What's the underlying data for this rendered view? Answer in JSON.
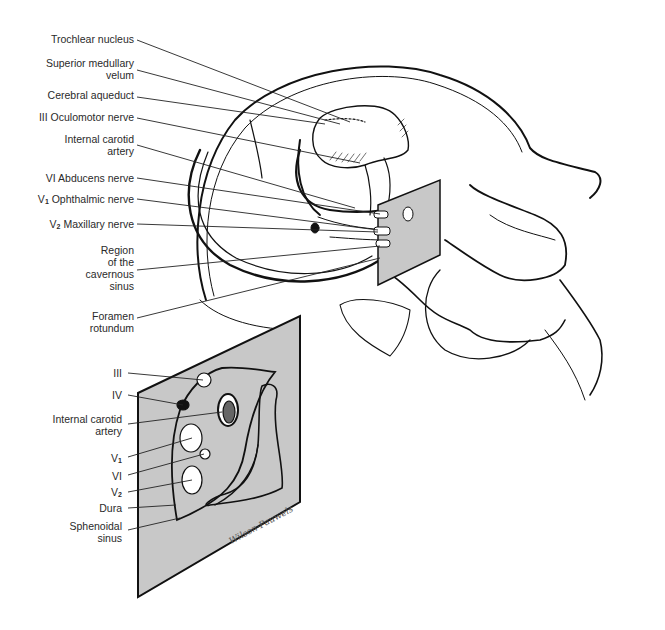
{
  "figure": {
    "panel_color": "#c8c8c8",
    "line_color": "#111111",
    "signature": "Wilson-Pauwels"
  },
  "main_labels": [
    {
      "id": "trochlear-nucleus",
      "lines": [
        "Trochlear nucleus"
      ]
    },
    {
      "id": "superior-medullary-velum",
      "lines": [
        "Superior medullary",
        "velum"
      ]
    },
    {
      "id": "cerebral-aqueduct",
      "lines": [
        "Cerebral aqueduct"
      ]
    },
    {
      "id": "oculomotor-nerve",
      "lines": [
        "III Oculomotor nerve"
      ]
    },
    {
      "id": "internal-carotid-artery",
      "lines": [
        "Internal carotid",
        "artery"
      ]
    },
    {
      "id": "abducens-nerve",
      "lines": [
        "VI Abducens nerve"
      ]
    },
    {
      "id": "ophthalmic-nerve",
      "prefix": "V",
      "sub": "1",
      "lines": [
        " Ophthalmic nerve"
      ]
    },
    {
      "id": "maxillary-nerve",
      "prefix": "V",
      "sub": "2",
      "lines": [
        " Maxillary nerve"
      ]
    },
    {
      "id": "cavernous-sinus-region",
      "lines": [
        "Region",
        "of the",
        "cavernous",
        "sinus"
      ]
    },
    {
      "id": "foramen-rotundum",
      "lines": [
        "Foramen",
        "rotundum"
      ]
    }
  ],
  "inset_labels": [
    {
      "id": "inset-iii",
      "lines": [
        "III"
      ]
    },
    {
      "id": "inset-iv",
      "lines": [
        "IV"
      ]
    },
    {
      "id": "inset-internal-carotid",
      "lines": [
        "Internal carotid",
        "artery"
      ]
    },
    {
      "id": "inset-v1",
      "prefix": "V",
      "sub": "1",
      "lines": [
        ""
      ]
    },
    {
      "id": "inset-vi",
      "lines": [
        "VI"
      ]
    },
    {
      "id": "inset-v2",
      "prefix": "V",
      "sub": "2",
      "lines": [
        ""
      ]
    },
    {
      "id": "inset-dura",
      "lines": [
        "Dura"
      ]
    },
    {
      "id": "inset-sphenoidal-sinus",
      "lines": [
        "Sphenoidal",
        "sinus"
      ]
    }
  ]
}
